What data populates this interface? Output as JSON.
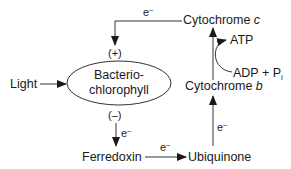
{
  "diagram": {
    "nodes": {
      "light": "Light",
      "bchl_line1": "Bacterio-",
      "bchl_line2": "chlorophyll",
      "ferredoxin": "Ferredoxin",
      "ubiquinone": "Ubiquinone",
      "cyt_b_name": "Cytochrome ",
      "cyt_b_suffix": "b",
      "cyt_c_name": "Cytochrome ",
      "cyt_c_suffix": "c",
      "atp": "ATP",
      "adp": "ADP + P",
      "adp_sub": "i"
    },
    "charges": {
      "positive": "(+)",
      "negative": "(–)"
    },
    "electron": {
      "symbol": "e",
      "superscript": "–"
    },
    "colors": {
      "line": "#333333",
      "text": "#1a1a1a",
      "background": "#ffffff"
    }
  }
}
